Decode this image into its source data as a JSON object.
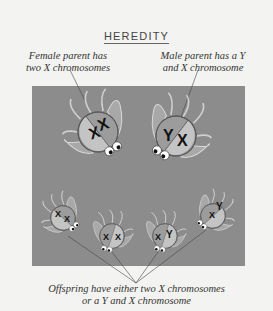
{
  "title": "HEREDITY",
  "labels": {
    "female_line1": "Female parent has",
    "female_line2": "two X chromosomes",
    "male_line1": "Male parent has a Y",
    "male_line2": "and X chromosome",
    "offspring_line1": "Offspring have either two X chromosomes",
    "offspring_line2": "or a Y and X chromosome"
  },
  "parents": [
    {
      "name": "female",
      "chromosomes": [
        "X",
        "X"
      ]
    },
    {
      "name": "male",
      "chromosomes": [
        "Y",
        "X"
      ]
    }
  ],
  "offspring": [
    {
      "chromosomes": [
        "X",
        "X"
      ]
    },
    {
      "chromosomes": [
        "X",
        "X"
      ]
    },
    {
      "chromosomes": [
        "X",
        "Y"
      ]
    },
    {
      "chromosomes": [
        "Y",
        "X"
      ]
    }
  ],
  "colors": {
    "panel": "#8c8c8c",
    "body_light": "#b8b8b8",
    "body_dark": "#9a9a9a",
    "background": "#f3f3f1"
  }
}
